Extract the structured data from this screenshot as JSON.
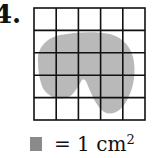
{
  "problem": {
    "number_label": "4."
  },
  "figure": {
    "grid": {
      "rows": 5,
      "cols": 5,
      "left": 34,
      "top": 8,
      "cell": 22.2,
      "line_color": "#111111"
    },
    "shape_color": "#b8b8b8"
  },
  "legend": {
    "swatch_color": "#8a8a8a",
    "equals": "= 1 cm",
    "exponent": "2"
  }
}
